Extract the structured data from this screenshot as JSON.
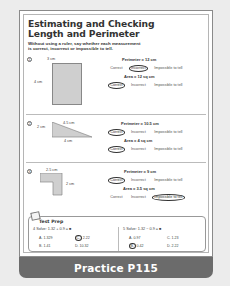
{
  "worksheet": {
    "title_line1": "Estimating and Checking",
    "title_line2": "Length and Perimeter",
    "instructions": {
      "part1": "Without using a ruler, say whether each measurement",
      "part2": "is ",
      "correct": "correct",
      "comma": ", ",
      "incorrect": "incorrect",
      "or": " or ",
      "impossible": "impossible to tell",
      "period": "."
    }
  },
  "choice_labels": {
    "correct": "Correct",
    "incorrect": "Incorrect",
    "impossible": "Impossible to tell"
  },
  "problems": [
    {
      "number": "1",
      "shape": "rectangle",
      "labels": {
        "top": "3 cm",
        "left": "4 cm"
      },
      "perimeter": {
        "text": "Perimeter = 12 cm",
        "answer": "Incorrect"
      },
      "area": {
        "text": "Area = 12 sq cm",
        "answer": "Correct"
      }
    },
    {
      "number": "2",
      "shape": "right triangle",
      "labels": {
        "left": "2 cm",
        "hypotenuse": "4.5 cm",
        "bottom": "4 cm"
      },
      "perimeter": {
        "text": "Perimeter = 10.5 cm",
        "answer": "Correct"
      },
      "area": {
        "text": "Area = 4 sq cm",
        "answer": "Correct"
      }
    },
    {
      "number": "3",
      "shape": "L-shape",
      "labels": {
        "top": "2.5 cm",
        "right": "2 cm"
      },
      "perimeter": {
        "text": "Perimeter = 9 cm",
        "answer": "Correct"
      },
      "area": {
        "text": "Area = 3.5 sq cm",
        "answer": "Impossible to tell"
      }
    }
  ],
  "test_prep": {
    "title": "Test Prep",
    "questions": [
      {
        "number": "4",
        "prompt": "Solve: 1.32 + 0.9 = ■",
        "options": [
          {
            "letter": "A.",
            "value": "1.329",
            "circled": false
          },
          {
            "letter": "C.",
            "value": "2.22",
            "circled": true
          },
          {
            "letter": "B.",
            "value": "1.41",
            "circled": false
          },
          {
            "letter": "D.",
            "value": "10.32",
            "circled": false
          }
        ]
      },
      {
        "number": "5",
        "prompt": "Solve: 1.32 − 0.9 = ■",
        "options": [
          {
            "letter": "A.",
            "value": "0.97",
            "circled": false
          },
          {
            "letter": "C.",
            "value": "1.23",
            "circled": false
          },
          {
            "letter": "B.",
            "value": "0.42",
            "circled": true
          },
          {
            "letter": "D.",
            "value": "2.22",
            "circled": false
          }
        ]
      }
    ]
  },
  "footer": {
    "label": "Practice P115"
  },
  "colors": {
    "footer_bg": "#6b6b6b",
    "shape_fill": "#cfcfcf",
    "background": "#ececec"
  }
}
